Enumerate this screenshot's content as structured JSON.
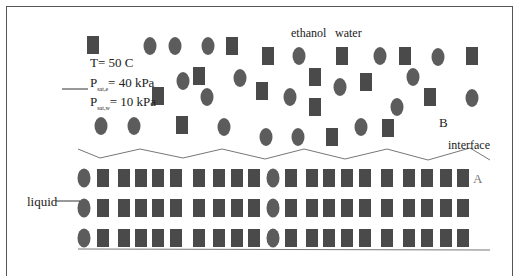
{
  "labels": {
    "temperature": "T= 50 C",
    "p_sat_e_prefix": "P",
    "p_sat_e_sub": "sat,e",
    "p_sat_e_value": "= 40 kPa",
    "p_sat_w_prefix": "P",
    "p_sat_w_sub": "sat,w",
    "p_sat_w_value": "= 10 kPa",
    "ethanol": "ethanol",
    "water": "water",
    "region_vapor": "B",
    "interface": "interface",
    "region_liquid": "A",
    "liquid": "liquid"
  },
  "legend": {
    "ethanol_shape": "circle",
    "water_shape": "square"
  },
  "colors": {
    "ethanol": "#5c5c5c",
    "water": "#4a4a4a",
    "line": "#777777"
  },
  "vapor_molecules": [
    {
      "species": "water",
      "x": 93,
      "y": 45
    },
    {
      "species": "ethanol",
      "x": 150,
      "y": 46
    },
    {
      "species": "ethanol",
      "x": 175,
      "y": 46
    },
    {
      "species": "ethanol",
      "x": 208,
      "y": 46
    },
    {
      "species": "water",
      "x": 232,
      "y": 46
    },
    {
      "species": "water",
      "x": 268,
      "y": 56
    },
    {
      "species": "ethanol",
      "x": 299,
      "y": 56
    },
    {
      "species": "water",
      "x": 342,
      "y": 56
    },
    {
      "species": "ethanol",
      "x": 380,
      "y": 56
    },
    {
      "species": "water",
      "x": 405,
      "y": 56
    },
    {
      "species": "ethanol",
      "x": 438,
      "y": 57
    },
    {
      "species": "water",
      "x": 472,
      "y": 56
    },
    {
      "species": "ethanol",
      "x": 183,
      "y": 81
    },
    {
      "species": "water",
      "x": 199,
      "y": 76
    },
    {
      "species": "ethanol",
      "x": 240,
      "y": 78
    },
    {
      "species": "water",
      "x": 315,
      "y": 77
    },
    {
      "species": "ethanol",
      "x": 340,
      "y": 87
    },
    {
      "species": "water",
      "x": 366,
      "y": 82
    },
    {
      "species": "ethanol",
      "x": 413,
      "y": 77
    },
    {
      "species": "water",
      "x": 158,
      "y": 96
    },
    {
      "species": "ethanol",
      "x": 207,
      "y": 97
    },
    {
      "species": "water",
      "x": 262,
      "y": 91
    },
    {
      "species": "ethanol",
      "x": 290,
      "y": 97
    },
    {
      "species": "water",
      "x": 315,
      "y": 107
    },
    {
      "species": "ethanol",
      "x": 397,
      "y": 107
    },
    {
      "species": "water",
      "x": 430,
      "y": 97
    },
    {
      "species": "ethanol",
      "x": 472,
      "y": 98
    },
    {
      "species": "ethanol",
      "x": 101,
      "y": 126
    },
    {
      "species": "ethanol",
      "x": 134,
      "y": 126
    },
    {
      "species": "water",
      "x": 182,
      "y": 125
    },
    {
      "species": "ethanol",
      "x": 224,
      "y": 127
    },
    {
      "species": "ethanol",
      "x": 266,
      "y": 137
    },
    {
      "species": "ethanol",
      "x": 298,
      "y": 137
    },
    {
      "species": "water",
      "x": 332,
      "y": 137
    },
    {
      "species": "ethanol",
      "x": 361,
      "y": 127
    },
    {
      "species": "water",
      "x": 388,
      "y": 128
    }
  ],
  "liquid_rows": 3,
  "liquid_row_pattern": [
    "ethanol",
    "water",
    "water",
    "water",
    "water",
    "water",
    "water",
    "water",
    "water",
    "water",
    "ethanol",
    "water",
    "water",
    "water",
    "water",
    "water",
    "water",
    "water",
    "water",
    "water",
    "water"
  ]
}
